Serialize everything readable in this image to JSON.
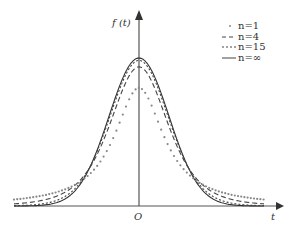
{
  "chart_data": {
    "type": "line",
    "title": "",
    "xlabel": "t",
    "ylabel": "f (t)",
    "origin_label": "O",
    "grid": false,
    "legend_position": "upper right",
    "legend": [
      {
        "name": "n=1",
        "style": "dotted-sparse",
        "label": "n=1"
      },
      {
        "name": "n=4",
        "style": "dashed",
        "label": "n=4"
      },
      {
        "name": "n=15",
        "style": "dotted-dense",
        "label": "n=15"
      },
      {
        "name": "n=∞",
        "style": "solid",
        "label": "n=∞"
      }
    ],
    "series": [
      {
        "name": "n=1",
        "peak": 0.32,
        "description": "Student t, 1 dof (Cauchy) — lowest peak, heaviest tails"
      },
      {
        "name": "n=4",
        "peak": 0.375
      },
      {
        "name": "n=15",
        "peak": 0.394
      },
      {
        "name": "n=∞",
        "peak": 0.399,
        "description": "standard normal"
      }
    ],
    "x_range": [
      -4.2,
      4.2
    ],
    "y_range": [
      0,
      0.55
    ]
  },
  "labels": {
    "y_axis": "f (t)",
    "x_axis": "t",
    "origin": "O",
    "legend_1": "n=1",
    "legend_2": "n=4",
    "legend_3": "n=15",
    "legend_4": "n=∞"
  }
}
